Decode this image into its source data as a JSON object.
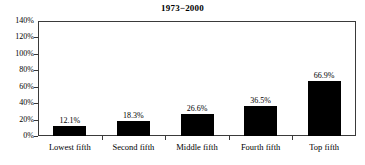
{
  "chart_data": {
    "type": "bar",
    "title": "1973−2000",
    "xlabel": "",
    "ylabel": "",
    "categories": [
      "Lowest fifth",
      "Second fifth",
      "Middle fifth",
      "Fourth fifth",
      "Top fifth"
    ],
    "values": [
      12.1,
      18.3,
      26.6,
      36.5,
      66.9
    ],
    "value_labels": [
      "12.1%",
      "18.3%",
      "26.6%",
      "36.5%",
      "66.9%"
    ],
    "ylim": [
      0,
      140
    ],
    "ytick_values": [
      0,
      20,
      40,
      60,
      80,
      100,
      120,
      140
    ],
    "ytick_labels": [
      "0%",
      "20%",
      "40%",
      "60%",
      "80%",
      "100%",
      "120%",
      "140%"
    ],
    "grid": false,
    "legend": null,
    "series": [
      {
        "name": "",
        "values": [
          12.1,
          18.3,
          26.6,
          36.5,
          66.9
        ]
      }
    ],
    "bar_color": "#000000",
    "axis_color": "#3a3a3a",
    "background_color": "#ffffff"
  }
}
